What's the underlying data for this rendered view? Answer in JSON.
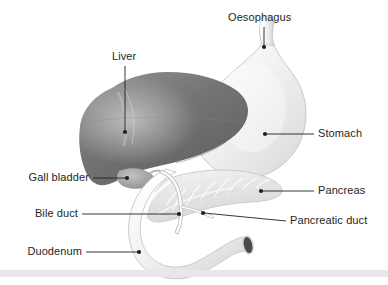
{
  "diagram": {
    "background_color": "#ffffff",
    "label_color": "#231f20",
    "leader_color": "#231f20",
    "divider_color": "#e6e8ea"
  },
  "labels": [
    {
      "id": "oesophagus",
      "text": "Oesophagus",
      "side": "top"
    },
    {
      "id": "liver",
      "text": "Liver",
      "side": "top"
    },
    {
      "id": "stomach",
      "text": "Stomach",
      "side": "right"
    },
    {
      "id": "pancreas",
      "text": "Pancreas",
      "side": "right"
    },
    {
      "id": "pancreatic-duct",
      "text": "Pancreatic duct",
      "side": "right"
    },
    {
      "id": "gall-bladder",
      "text": "Gall bladder",
      "side": "left"
    },
    {
      "id": "bile-duct",
      "text": "Bile duct",
      "side": "left"
    },
    {
      "id": "duodenum",
      "text": "Duodenum",
      "side": "left"
    }
  ],
  "organs": {
    "liver": {
      "name": "Liver",
      "fill": "#6e6e6e"
    },
    "stomach": {
      "name": "Stomach",
      "fill": "#f2f2f0"
    },
    "pancreas": {
      "name": "Pancreas",
      "fill": "#e4e5e3"
    },
    "duodenum": {
      "name": "Duodenum",
      "fill": "#efefed"
    },
    "gallbladder": {
      "name": "Gall bladder",
      "fill": "#a8a8a6"
    },
    "bileduct": {
      "name": "Bile duct",
      "fill": "#fbfbfa"
    }
  }
}
